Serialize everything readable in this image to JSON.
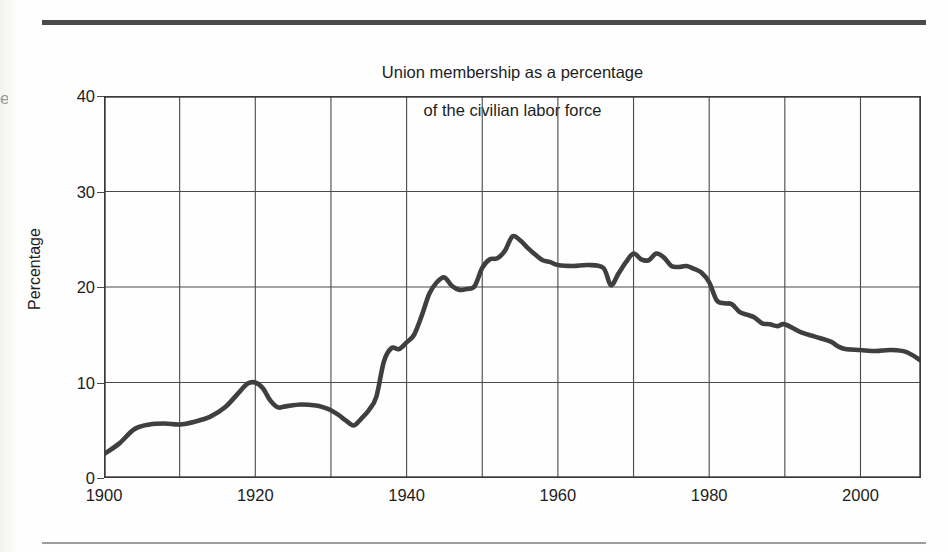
{
  "figure": {
    "title_line1": "Union membership as a percentage",
    "title_line2": "of the civilian labor force",
    "edge_glyph": "e"
  },
  "chart_data": {
    "type": "line",
    "title": "Union membership as a percentage of the civilian labor force",
    "xlabel": "",
    "ylabel": "Percentage",
    "xlim": [
      1900,
      2008
    ],
    "ylim": [
      0,
      40
    ],
    "yticks": [
      0,
      10,
      20,
      30,
      40
    ],
    "ytick_labels": [
      "0",
      "10",
      "20",
      "30",
      "40"
    ],
    "xticks": [
      1900,
      1920,
      1940,
      1960,
      1980,
      2000
    ],
    "xtick_labels": [
      "1900",
      "1920",
      "1940",
      "1960",
      "1980",
      "2000"
    ],
    "x_gridlines": [
      1910,
      1920,
      1930,
      1940,
      1950,
      1960,
      1970,
      1980,
      1990,
      2000
    ],
    "y_gridlines": [
      10,
      20,
      30
    ],
    "grid": true,
    "legend": null,
    "line_color": "#3f3f3f",
    "line_width": 4.6,
    "series": [
      {
        "name": "Union membership (% of civilian labor force)",
        "x": [
          1900,
          1902,
          1904,
          1906,
          1908,
          1910,
          1912,
          1914,
          1916,
          1918,
          1919,
          1920,
          1921,
          1922,
          1923,
          1924,
          1926,
          1928,
          1929,
          1930,
          1931,
          1932,
          1933,
          1934,
          1935,
          1936,
          1937,
          1938,
          1939,
          1940,
          1941,
          1942,
          1943,
          1944,
          1945,
          1946,
          1947,
          1948,
          1949,
          1950,
          1951,
          1952,
          1953,
          1954,
          1955,
          1956,
          1957,
          1958,
          1959,
          1960,
          1962,
          1964,
          1966,
          1967,
          1968,
          1969,
          1970,
          1971,
          1972,
          1973,
          1974,
          1975,
          1976,
          1977,
          1978,
          1979,
          1980,
          1981,
          1982,
          1983,
          1984,
          1985,
          1986,
          1987,
          1988,
          1989,
          1990,
          1992,
          1994,
          1996,
          1997,
          1998,
          2000,
          2002,
          2004,
          2006,
          2008
        ],
        "y": [
          2.5,
          3.6,
          5.1,
          5.6,
          5.7,
          5.6,
          5.9,
          6.4,
          7.4,
          9.1,
          9.9,
          10.0,
          9.4,
          8.1,
          7.4,
          7.5,
          7.7,
          7.6,
          7.4,
          7.1,
          6.6,
          6.0,
          5.5,
          6.2,
          7.1,
          8.5,
          12.2,
          13.6,
          13.5,
          14.2,
          15.0,
          17.0,
          19.3,
          20.5,
          21.0,
          20.1,
          19.7,
          19.8,
          20.1,
          22.0,
          22.9,
          23.0,
          23.8,
          25.3,
          24.9,
          24.1,
          23.4,
          22.8,
          22.6,
          22.3,
          22.2,
          22.3,
          22.0,
          20.2,
          21.4,
          22.6,
          23.5,
          22.9,
          22.8,
          23.5,
          23.1,
          22.2,
          22.1,
          22.2,
          21.9,
          21.5,
          20.5,
          18.6,
          18.3,
          18.2,
          17.4,
          17.1,
          16.8,
          16.2,
          16.1,
          15.9,
          16.1,
          15.3,
          14.8,
          14.3,
          13.8,
          13.5,
          13.4,
          13.3,
          13.4,
          13.2,
          12.3
        ]
      }
    ]
  }
}
